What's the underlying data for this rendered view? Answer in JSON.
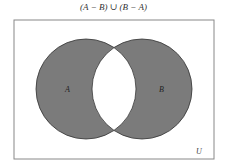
{
  "title": "(A − B) ∪ (B − A)",
  "diagram": {
    "universe_label": "U",
    "sets": [
      {
        "label": "A",
        "cx": 86,
        "cy": 89,
        "r": 50
      },
      {
        "label": "B",
        "cx": 142,
        "cy": 89,
        "r": 50
      }
    ],
    "shaded_region": "symmetric difference",
    "fill_color": "#7b7b7b",
    "stroke_color": "#333333"
  }
}
